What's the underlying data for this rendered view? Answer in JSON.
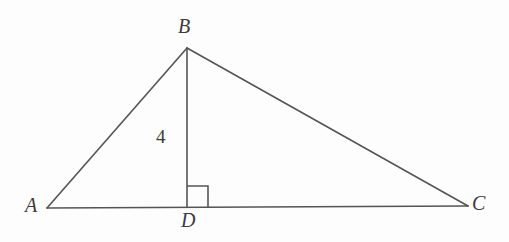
{
  "figure": {
    "type": "geometry-diagram",
    "background_color": "#fdfdfd",
    "stroke_color": "#555555",
    "text_color": "#3b3b3b",
    "stroke_width": 1.6,
    "labels": {
      "vertex_a": "A",
      "vertex_b": "B",
      "vertex_c": "C",
      "vertex_d": "D",
      "altitude_length": "4"
    },
    "points": {
      "A": {
        "x": 47,
        "y": 208
      },
      "B": {
        "x": 187,
        "y": 48
      },
      "C": {
        "x": 468,
        "y": 206
      },
      "D": {
        "x": 187,
        "y": 207
      }
    },
    "segments": [
      {
        "name": "AB",
        "from": "A",
        "to": "B"
      },
      {
        "name": "BC",
        "from": "B",
        "to": "C"
      },
      {
        "name": "AC",
        "from": "A",
        "to": "C"
      },
      {
        "name": "BD",
        "from": "B",
        "to": "D"
      }
    ],
    "right_angle_marker": {
      "at": "D",
      "size": 21,
      "orientation": "toward-C"
    }
  }
}
